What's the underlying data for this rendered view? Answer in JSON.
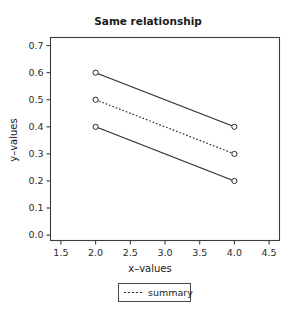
{
  "chart_data": {
    "type": "line",
    "title": "Same relationship",
    "xlabel": "x–values",
    "ylabel": "y–values",
    "xlim": [
      1.35,
      4.65
    ],
    "ylim": [
      -0.02,
      0.73
    ],
    "grid": false,
    "x": [
      2.0,
      4.0
    ],
    "xticks": [
      1.5,
      2.0,
      2.5,
      3.0,
      3.5,
      4.0,
      4.5
    ],
    "xticklabels": [
      "1.5",
      "2.0",
      "2.5",
      "3.0",
      "3.5",
      "4.0",
      "4.5"
    ],
    "yticks": [
      0.0,
      0.1,
      0.2,
      0.3,
      0.4,
      0.5,
      0.6,
      0.7
    ],
    "yticklabels": [
      "0.0",
      "0.1",
      "0.2",
      "0.3",
      "0.4",
      "0.5",
      "0.6",
      "0.7"
    ],
    "series": [
      {
        "name": "upper",
        "style": "solid",
        "values": [
          0.6,
          0.4
        ],
        "marker": "open-circle"
      },
      {
        "name": "summary",
        "style": "dashed",
        "values": [
          0.5,
          0.3
        ],
        "marker": "open-circle"
      },
      {
        "name": "lower",
        "style": "solid",
        "values": [
          0.4,
          0.2
        ],
        "marker": "open-circle"
      }
    ],
    "legend": {
      "position": "below-axis",
      "entries": [
        {
          "label": "summary",
          "style": "dashed"
        }
      ]
    },
    "colors": {
      "line": "#2b2b2b",
      "frame": "#3d3d3d",
      "text": "#1a1a1a",
      "background": "#ffffff"
    }
  }
}
